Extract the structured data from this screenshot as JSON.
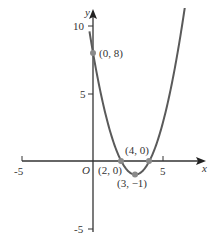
{
  "chart_data": {
    "type": "line",
    "title": "",
    "xlabel": "x",
    "ylabel": "y",
    "equation": "y = x^2 - 6x + 8",
    "xlim": [
      -5,
      8
    ],
    "ylim": [
      -5,
      10
    ],
    "grid": false,
    "x_ticks": [
      -5,
      5
    ],
    "y_ticks": [
      10,
      5,
      -5
    ],
    "origin_label": "O",
    "curve_color": "#5a5a5a",
    "point_color": "#8a8a8a",
    "series": [
      {
        "name": "parabola",
        "x": [
          -0.2,
          0,
          1,
          2,
          3,
          4,
          5,
          6,
          7,
          8
        ],
        "y": [
          9.24,
          8,
          3,
          0,
          -1,
          0,
          3,
          8,
          15,
          24
        ]
      }
    ],
    "annotations": [
      {
        "label": "(0, 8)",
        "x": 0,
        "y": 8
      },
      {
        "label": "(2, 0)",
        "x": 2,
        "y": 0
      },
      {
        "label": "(4, 0)",
        "x": 4,
        "y": 0
      },
      {
        "label": "(3, −1)",
        "x": 3,
        "y": -1
      }
    ]
  }
}
